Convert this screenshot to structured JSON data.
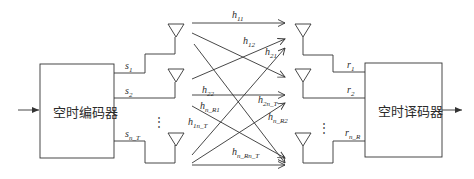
{
  "diagram": {
    "type": "MIMO space-time coding block diagram",
    "encoder": {
      "label": "空时编码器"
    },
    "decoder": {
      "label": "空时译码器"
    },
    "transmit_signals": [
      {
        "base": "s",
        "sub": "1"
      },
      {
        "base": "s",
        "sub": "2"
      },
      {
        "base": "s",
        "sub": "n_T"
      }
    ],
    "receive_signals": [
      {
        "base": "r",
        "sub": "1"
      },
      {
        "base": "r",
        "sub": "2"
      },
      {
        "base": "r",
        "sub": "n_R"
      }
    ],
    "ellipsis": "⋮",
    "channel_labels": [
      {
        "base": "h",
        "sub": "11"
      },
      {
        "base": "h",
        "sub": "12"
      },
      {
        "base": "h",
        "sub": "21"
      },
      {
        "base": "h",
        "sub": "22"
      },
      {
        "base": "h",
        "sub": "2n_T"
      },
      {
        "base": "h",
        "sub": "n_R1"
      },
      {
        "base": "h",
        "sub": "1n_T"
      },
      {
        "base": "h",
        "sub": "n_R2"
      },
      {
        "base": "h",
        "sub": "n_Rn_T"
      }
    ],
    "icons": {
      "tx_antenna": "antenna-icon",
      "rx_antenna": "antenna-icon",
      "input_arrow": "arrow-right-icon",
      "output_arrow": "arrow-right-icon"
    }
  }
}
